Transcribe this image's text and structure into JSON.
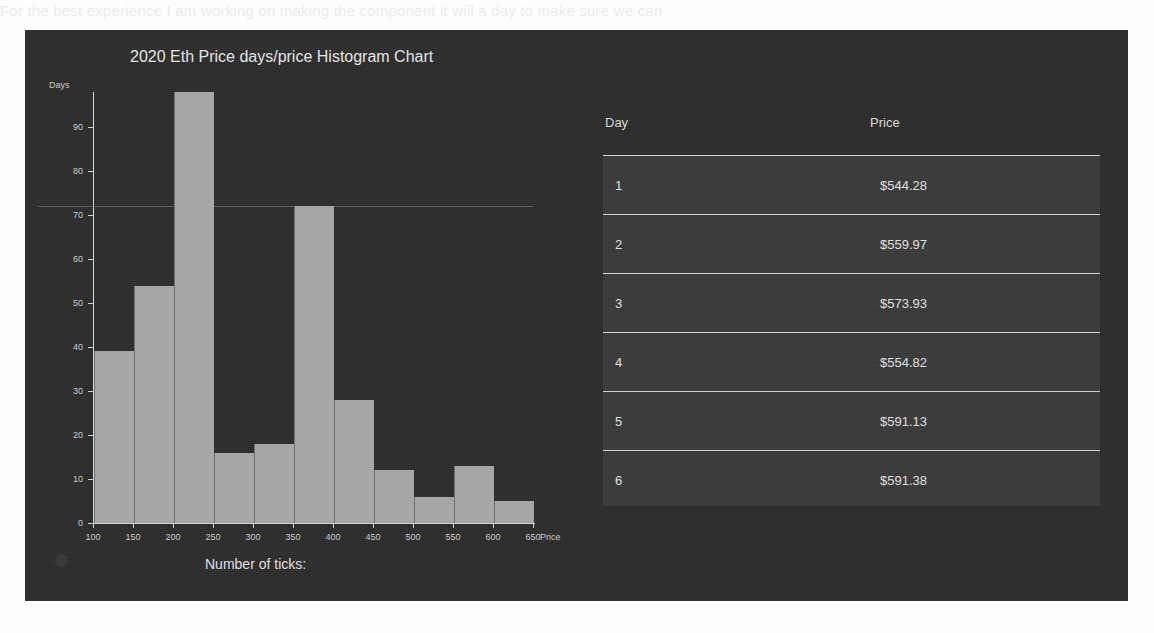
{
  "background": {
    "page_color": "#fdfdfd",
    "panel_color": "#2c2c2c",
    "ghost_text_top": "For the best experience I am working on making the component it will  a day to make sure we can",
    "ghost_text_bottom": ""
  },
  "chart": {
    "title": "2020 Eth Price days/price Histogram Chart",
    "ylabel": "Days",
    "xlabel": "Price",
    "ticks_prompt": "Number of ticks:",
    "bar_color": "#a8a8a8",
    "axis_color": "#d8d8d8"
  },
  "table": {
    "columns": [
      "Day",
      "Price"
    ],
    "rows": [
      {
        "day": "1",
        "price": "$544.28"
      },
      {
        "day": "2",
        "price": "$559.97"
      },
      {
        "day": "3",
        "price": "$573.93"
      },
      {
        "day": "4",
        "price": "$554.82"
      },
      {
        "day": "5",
        "price": "$591.13"
      },
      {
        "day": "6",
        "price": "$591.38"
      },
      {
        "day": "7",
        "price": "$600.70"
      }
    ]
  },
  "chart_data": {
    "type": "bar",
    "title": "2020 Eth Price days/price Histogram Chart",
    "xlabel": "Price",
    "ylabel": "Days",
    "grid": false,
    "legend": "none",
    "bin_width": 50,
    "bin_edges": [
      100,
      150,
      200,
      250,
      300,
      350,
      400,
      450,
      500,
      550,
      600,
      650
    ],
    "categories": [
      "100-150",
      "150-200",
      "200-250",
      "250-300",
      "300-350",
      "350-400",
      "400-450",
      "450-500",
      "500-550",
      "550-600",
      "600-650"
    ],
    "values": [
      39,
      54,
      98,
      16,
      18,
      72,
      28,
      12,
      6,
      13,
      5
    ],
    "xlim": [
      100,
      650
    ],
    "ylim": [
      0,
      98
    ],
    "xticks": [
      100,
      150,
      200,
      250,
      300,
      350,
      400,
      450,
      500,
      550,
      600,
      650
    ],
    "yticks": [
      0,
      10,
      20,
      30,
      40,
      50,
      60,
      70,
      80,
      90
    ],
    "highlight_line_y": 72
  }
}
